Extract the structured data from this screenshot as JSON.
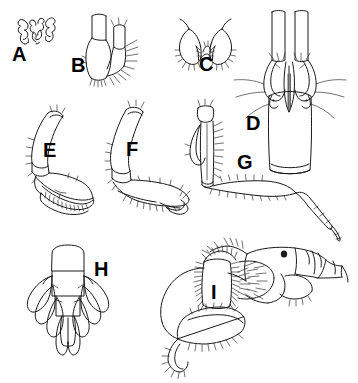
{
  "figure": {
    "kind": "scientific-illustration-plate",
    "background_color": "#ffffff",
    "ink_color": "#1a1a1a",
    "width": 358,
    "height": 383,
    "panels": [
      {
        "id": "A",
        "label": "A",
        "name": "panel-a",
        "x": 12,
        "y": 44,
        "description": "paired small hook-like mandibular lacinia / accessory structures, dorsal view"
      },
      {
        "id": "B",
        "label": "B",
        "name": "panel-b",
        "x": 71,
        "y": 55,
        "description": "maxilliped palp article bearing marginal setae"
      },
      {
        "id": "C",
        "label": "C",
        "name": "panel-c",
        "x": 199,
        "y": 54,
        "description": "paired lobes of lower lip (labium), setose margins"
      },
      {
        "id": "D",
        "label": "D",
        "name": "panel-d",
        "x": 246,
        "y": 113,
        "description": "telson and uropods, stippled, dorsal view"
      },
      {
        "id": "E",
        "label": "E",
        "name": "panel-e",
        "x": 43,
        "y": 140,
        "description": "gnathopod with ovate propodus and palm setae"
      },
      {
        "id": "F",
        "label": "F",
        "name": "panel-f",
        "x": 126,
        "y": 139,
        "description": "second gnathopod, broad propodus with marginal setae"
      },
      {
        "id": "G",
        "label": "G",
        "name": "panel-g",
        "x": 237,
        "y": 152,
        "description": "pereopod with elongate basis, merus and slender dactylus"
      },
      {
        "id": "H",
        "label": "H",
        "name": "panel-h",
        "x": 94,
        "y": 259,
        "description": "urosome with uropods and telson, dorsal view"
      },
      {
        "id": "I",
        "label": "I",
        "name": "panel-i",
        "x": 211,
        "y": 282,
        "description": "whole cephalon and appendages in lateral view with dense setation"
      }
    ]
  }
}
